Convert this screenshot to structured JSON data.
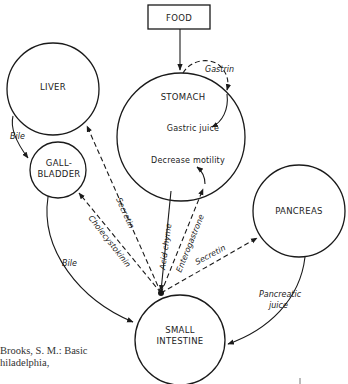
{
  "diagram": {
    "nodes": {
      "food": "FOOD",
      "liver": "LIVER",
      "stomach": "STOMACH",
      "gallbladder_line1": "GALL-",
      "gallbladder_line2": "BLADDER",
      "pancreas": "PANCREAS",
      "small_intestine_line1": "SMALL",
      "small_intestine_line2": "INTESTINE"
    },
    "stomach_inner": {
      "gastric_juice": "Gastric juice",
      "decrease_motility": "Decrease motility"
    },
    "edges": {
      "gastrin": "Gastrin",
      "bile_liver_gb": "Bile",
      "bile_gb_si": "Bile",
      "cholecystokinin": "Cholecystokinin",
      "secretin_liver": "Secretin",
      "acid_chyme": "Acid chyme",
      "enterogastrone": "Enterogastrone",
      "secretin_pancreas": "Secretin",
      "pancreatic_juice_line1": "Pancreatic",
      "pancreatic_juice_line2": "juice"
    },
    "citation": {
      "line1": "Brooks, S. M.: Basic",
      "line2": "hiladelphia,"
    }
  }
}
